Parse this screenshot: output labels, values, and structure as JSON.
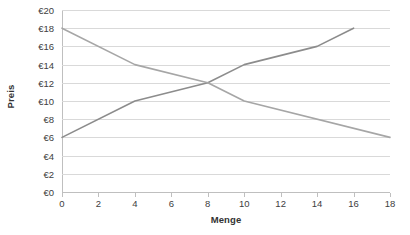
{
  "chart_data": {
    "type": "line",
    "title": "",
    "xlabel": "Menge",
    "ylabel": "Preis",
    "xlim": [
      0,
      18
    ],
    "ylim": [
      0,
      20
    ],
    "grid": true,
    "grid_orientation": "horizontal",
    "legend": "none",
    "x_ticks": [
      0,
      2,
      4,
      6,
      8,
      10,
      12,
      14,
      16,
      18
    ],
    "x_tick_labels": [
      "0",
      "2",
      "4",
      "6",
      "8",
      "10",
      "12",
      "14",
      "16",
      "18"
    ],
    "y_ticks": [
      0,
      2,
      4,
      6,
      8,
      10,
      12,
      14,
      16,
      18,
      20
    ],
    "y_tick_labels": [
      "€0",
      "€2",
      "€4",
      "€6",
      "€8",
      "€10",
      "€12",
      "€14",
      "€16",
      "€18",
      "€20"
    ],
    "series": [
      {
        "name": "supply",
        "color": "#8c8c8c",
        "line_width": 1.6,
        "x": [
          0,
          4,
          8,
          10,
          14,
          16
        ],
        "values": [
          6,
          10,
          12,
          14,
          16,
          18
        ]
      },
      {
        "name": "demand",
        "color": "#a6a6a6",
        "line_width": 1.6,
        "x": [
          0,
          4,
          8,
          10,
          18
        ],
        "values": [
          18,
          14,
          12,
          10,
          6
        ]
      }
    ],
    "intersection": {
      "x": 8,
      "y": 12
    }
  },
  "colors": {
    "gridline": "#d9d9d9",
    "axis": "#bfbfbf",
    "tick_text": "#404040",
    "axis_title_text": "#333333",
    "background": "#ffffff"
  }
}
